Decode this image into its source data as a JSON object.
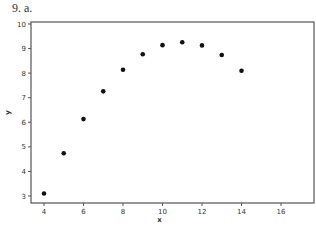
{
  "problem_label": "9.  a.",
  "chart_data": {
    "type": "scatter",
    "title": "",
    "xlabel": "x",
    "ylabel": "y",
    "xlim": [
      3.25,
      17.6
    ],
    "ylim": [
      2.7,
      10.1
    ],
    "xticks": [
      4,
      6,
      8,
      10,
      12,
      14,
      16
    ],
    "yticks": [
      3,
      4,
      5,
      6,
      7,
      8,
      9,
      10
    ],
    "grid": false,
    "legend": null,
    "series": [
      {
        "name": "data",
        "x": [
          4,
          5,
          6,
          7,
          8,
          9,
          10,
          11,
          12,
          13,
          14
        ],
        "y": [
          3.1,
          4.74,
          6.13,
          7.26,
          8.14,
          8.77,
          9.14,
          9.26,
          9.13,
          8.74,
          8.1
        ]
      }
    ],
    "colors": {
      "points": "#111111",
      "axes": "#555555"
    }
  }
}
